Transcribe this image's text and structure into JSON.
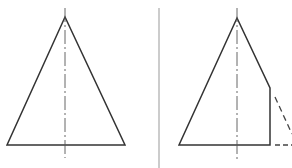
{
  "diagram": {
    "type": "technical-drawing",
    "colors": {
      "outline": "#333333",
      "centerline": "#555555",
      "divider": "#999999",
      "hidden": "#444444",
      "background": "#ffffff"
    },
    "views": [
      {
        "name": "full-cone-view",
        "outline_points": [
          [
            65,
            17
          ],
          [
            7,
            145
          ],
          [
            125,
            145
          ]
        ],
        "centerline": {
          "x": 65,
          "y1": 8,
          "y2": 158
        }
      },
      {
        "name": "cut-cone-view",
        "outline_points": [
          [
            237,
            18
          ],
          [
            179,
            145
          ],
          [
            270,
            145
          ],
          [
            270,
            88
          ]
        ],
        "centerline": {
          "x": 237,
          "y1": 8,
          "y2": 160
        },
        "hidden_lines": [
          {
            "x1": 275,
            "y1": 97,
            "x2": 292,
            "y2": 134
          },
          {
            "x1": 275,
            "y1": 145,
            "x2": 292,
            "y2": 145
          }
        ]
      }
    ],
    "divider": {
      "x": 159,
      "y1": 8,
      "y2": 168
    }
  }
}
